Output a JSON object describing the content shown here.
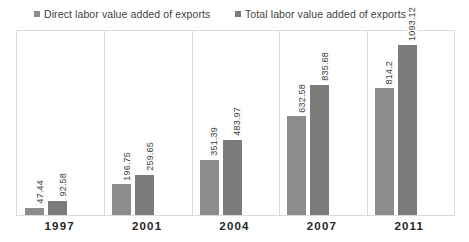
{
  "legend": {
    "entries": [
      {
        "label": "Direct labor value added of exports",
        "color": "#8c8c8c",
        "icon": "square-marker-icon"
      },
      {
        "label": "Total labor value added of exports",
        "color": "#7b7b7b",
        "icon": "square-marker-icon"
      }
    ]
  },
  "axis": {
    "categories": [
      "1997",
      "2001",
      "2004",
      "2007",
      "2011"
    ]
  },
  "values": {
    "direct": [
      "47.44",
      "196.75",
      "351.39",
      "632.58",
      "814.2"
    ],
    "total": [
      "92.58",
      "259.65",
      "483.97",
      "835.68",
      "1093.12"
    ]
  },
  "colors": {
    "series_direct": "#8c8c8c",
    "series_total": "#7b7b7b",
    "frame": "#d9d9d9",
    "label_text": "#404040",
    "category_text": "#262626",
    "background": "#ffffff"
  },
  "chart_data": {
    "type": "bar",
    "title": "",
    "subtitle": "",
    "xlabel": "",
    "ylabel": "",
    "categories": [
      "1997",
      "2001",
      "2004",
      "2007",
      "2011"
    ],
    "series": [
      {
        "name": "Direct labor value added of exports",
        "color": "#8c8c8c",
        "values": [
          47.44,
          196.75,
          351.39,
          632.58,
          814.2
        ]
      },
      {
        "name": "Total labor value added of exports",
        "color": "#7b7b7b",
        "values": [
          92.58,
          259.65,
          483.97,
          835.68,
          1093.12
        ]
      }
    ],
    "ylim": [
      0,
      1180
    ],
    "grid": false,
    "category_separators": true,
    "legend_position": "top",
    "data_labels": "rotated-vertical-above-bar",
    "axis_tick_labels_y": []
  }
}
